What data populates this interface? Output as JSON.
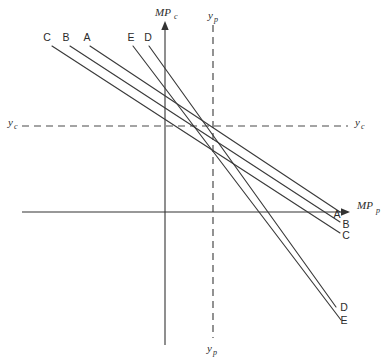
{
  "figure": {
    "background_color": "#ffffff",
    "line_color": "#3a3a3a",
    "axis_color": "#333333",
    "dash_color": "#4a4a4a"
  },
  "axes": {
    "vertical_solid": {
      "name": "MP_c",
      "label_main": "MP",
      "label_sub": "c",
      "x": 165,
      "y_top": 22,
      "y_bottom": 345,
      "arrow": "up"
    },
    "horizontal_solid": {
      "name": "MP_p",
      "label_main": "MP",
      "label_sub": "p",
      "x_left": 22,
      "x_right": 350,
      "y": 212,
      "arrow": "right"
    },
    "vertical_dashed": {
      "name": "y_p",
      "label_main": "y",
      "label_sub": "p",
      "x": 213,
      "y_top": 25,
      "y_bottom": 338,
      "label_top": "y_p",
      "label_bottom": "y_p"
    },
    "horizontal_dashed": {
      "name": "y_c",
      "label_main": "y",
      "label_sub": "c",
      "y": 126,
      "x_left": 22,
      "x_right": 348,
      "label_left": "y_c",
      "label_right": "y_c"
    }
  },
  "intersection": {
    "x": 213,
    "y": 126
  },
  "curves": [
    {
      "id": "C",
      "label": "C",
      "label_top": "C",
      "label_end": "C",
      "x1": 52,
      "y1": 46,
      "x2": 340,
      "y2": 233,
      "top_label_x": 49,
      "top_label_y": 40,
      "end_label_x": 343,
      "end_label_y": 237
    },
    {
      "id": "B",
      "label": "B",
      "label_top": "B",
      "label_end": "B",
      "x1": 70,
      "y1": 46,
      "x2": 340,
      "y2": 222,
      "top_label_x": 67,
      "top_label_y": 40,
      "end_label_x": 343,
      "end_label_y": 226
    },
    {
      "id": "A",
      "label": "A",
      "label_top": "A",
      "label_end": "A",
      "x1": 90,
      "y1": 46,
      "x2": 340,
      "y2": 212,
      "top_label_x": 87,
      "top_label_y": 40,
      "end_label_x": 331,
      "end_label_y": 216
    },
    {
      "id": "E",
      "label": "E",
      "label_top": "E",
      "label_end": "E",
      "x1": 133,
      "y1": 46,
      "x2": 341,
      "y2": 320,
      "top_label_x": 130,
      "top_label_y": 40,
      "end_label_x": 344,
      "end_label_y": 324
    },
    {
      "id": "D",
      "label": "D",
      "label_top": "D",
      "label_end": "D",
      "x1": 149,
      "y1": 46,
      "x2": 336,
      "y2": 307,
      "top_label_x": 146,
      "top_label_y": 40,
      "end_label_x": 339,
      "end_label_y": 311
    }
  ]
}
